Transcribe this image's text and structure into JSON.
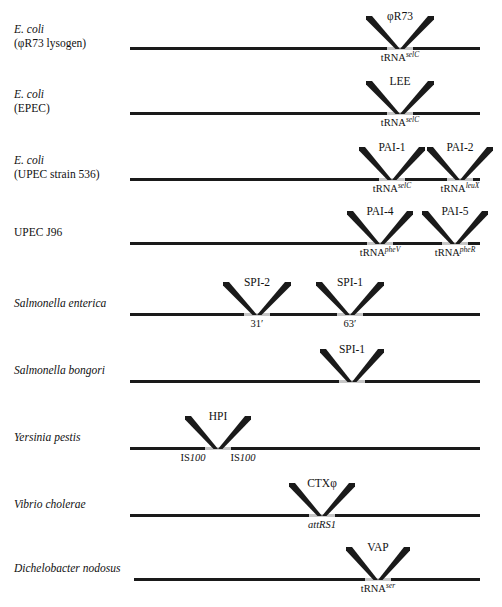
{
  "figure": {
    "backbone_color": "#1a1a1a",
    "gap_color": "#c6c6c6"
  },
  "rows": [
    {
      "organism_lines": [
        "E. coli",
        "(φR73 lysogen)"
      ],
      "organism_italic": [
        true,
        false
      ],
      "islands": [
        {
          "label": "φR73",
          "site_prefix": "tRNA",
          "site_sup": "selC",
          "site_italic_prefix": false
        }
      ]
    },
    {
      "organism_lines": [
        "E. coli",
        "(EPEC)"
      ],
      "organism_italic": [
        true,
        false
      ],
      "islands": [
        {
          "label": "LEE",
          "site_prefix": "tRNA",
          "site_sup": "selC",
          "site_italic_prefix": false
        }
      ]
    },
    {
      "organism_lines": [
        "E. coli",
        "(UPEC strain 536)"
      ],
      "organism_italic": [
        true,
        false
      ],
      "islands": [
        {
          "label": "PAI-1",
          "site_prefix": "tRNA",
          "site_sup": "selC",
          "site_italic_prefix": false
        },
        {
          "label": "PAI-2",
          "site_prefix": "tRNA",
          "site_sup": "leuX",
          "site_italic_prefix": false
        }
      ]
    },
    {
      "organism_lines": [
        "UPEC J96"
      ],
      "organism_italic": [
        false
      ],
      "islands": [
        {
          "label": "PAI-4",
          "site_prefix": "tRNA",
          "site_sup": "pheV",
          "site_italic_prefix": false
        },
        {
          "label": "PAI-5",
          "site_prefix": "tRNA",
          "site_sup": "pheR",
          "site_italic_prefix": false
        }
      ]
    },
    {
      "organism_lines": [
        "Salmonella enterica"
      ],
      "organism_italic": [
        true
      ],
      "islands": [
        {
          "label": "SPI-2",
          "site_prefix": "31′",
          "site_sup": "",
          "site_italic_prefix": false
        },
        {
          "label": "SPI-1",
          "site_prefix": "63′",
          "site_sup": "",
          "site_italic_prefix": false
        }
      ]
    },
    {
      "organism_lines": [
        "Salmonella bongori"
      ],
      "organism_italic": [
        true
      ],
      "islands": [
        {
          "label": "SPI-1",
          "site_prefix": "",
          "site_sup": "",
          "site_italic_prefix": false
        }
      ]
    },
    {
      "organism_lines": [
        "Yersinia pestis"
      ],
      "organism_italic": [
        true
      ],
      "islands": [
        {
          "label": "HPI",
          "site_prefix": "",
          "site_sup": "",
          "site_italic_prefix": false
        }
      ],
      "flank_labels": [
        "IS100",
        "IS100"
      ]
    },
    {
      "organism_lines": [
        "Vibrio cholerae"
      ],
      "organism_italic": [
        true
      ],
      "islands": [
        {
          "label": "CTXφ",
          "site_prefix": "attRS1",
          "site_sup": "",
          "site_italic_prefix": true
        }
      ]
    },
    {
      "organism_lines": [
        "Dichelobacter nodosus"
      ],
      "organism_italic": [
        true
      ],
      "islands": [
        {
          "label": "VAP",
          "site_prefix": "tRNA",
          "site_sup": "ser",
          "site_italic_prefix": false
        }
      ]
    }
  ],
  "layout": {
    "rows": [
      {
        "baseline_y": 47,
        "line_x": 130,
        "line_w": 350,
        "name_y": 33,
        "apexes": [
          400
        ],
        "halfwidth": 34
      },
      {
        "baseline_y": 112,
        "line_x": 130,
        "line_w": 350,
        "name_y": 98,
        "apexes": [
          400
        ],
        "halfwidth": 34
      },
      {
        "baseline_y": 178,
        "line_x": 130,
        "line_w": 350,
        "name_y": 164,
        "apexes": [
          392,
          460
        ],
        "halfwidth": 33
      },
      {
        "baseline_y": 242,
        "line_x": 130,
        "line_w": 350,
        "name_y": 236,
        "apexes": [
          380,
          455
        ],
        "halfwidth": 33
      },
      {
        "baseline_y": 313,
        "line_x": 130,
        "line_w": 350,
        "name_y": 307,
        "apexes": [
          257,
          350
        ],
        "halfwidth": 34
      },
      {
        "baseline_y": 380,
        "line_x": 130,
        "line_w": 350,
        "name_y": 374,
        "apexes": [
          352
        ],
        "halfwidth": 32
      },
      {
        "baseline_y": 447,
        "line_x": 130,
        "line_w": 350,
        "name_y": 441,
        "apexes": [
          218
        ],
        "halfwidth": 33
      },
      {
        "baseline_y": 514,
        "line_x": 130,
        "line_w": 350,
        "name_y": 508,
        "apexes": [
          322
        ],
        "halfwidth": 33
      },
      {
        "baseline_y": 578,
        "line_x": 134,
        "line_w": 346,
        "name_y": 572,
        "apexes": [
          378
        ],
        "halfwidth": 32
      }
    ]
  }
}
